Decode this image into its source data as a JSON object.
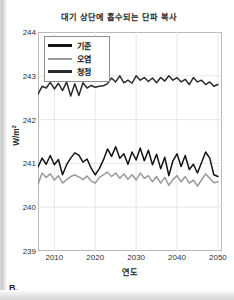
{
  "panel": {
    "label": "B."
  },
  "chart_data": {
    "type": "line",
    "title": "대기 상단에 흡수되는 단파 복사",
    "xlabel": "연도",
    "ylabel": "W/m",
    "ylabel_exponent": "2",
    "xlim": [
      2006,
      2051
    ],
    "ylim": [
      239,
      244
    ],
    "yticks": [
      239,
      240,
      241,
      242,
      243,
      244
    ],
    "ytick_labels": [
      "239",
      "240",
      "241",
      "242",
      "243",
      "244"
    ],
    "xticks": [
      2010,
      2020,
      2030,
      2040,
      2050
    ],
    "xtick_labels": [
      "2010",
      "2020",
      "2030",
      "2040",
      "2050"
    ],
    "grid": true,
    "grid_color": "#e6e6e6",
    "legend_position": "upper left",
    "legend": [
      "기준",
      "오염",
      "청정"
    ],
    "series": [
      {
        "name": "기준",
        "color": "#141414",
        "width": 1.5,
        "x": [
          2006,
          2007,
          2008,
          2009,
          2010,
          2011,
          2012,
          2013,
          2014,
          2015,
          2016,
          2017,
          2018,
          2019,
          2020,
          2021,
          2022,
          2023,
          2024,
          2025,
          2026,
          2027,
          2028,
          2029,
          2030,
          2031,
          2032,
          2033,
          2034,
          2035,
          2036,
          2037,
          2038,
          2039,
          2040,
          2041,
          2042,
          2043,
          2044,
          2045,
          2046,
          2047,
          2048,
          2049,
          2050
        ],
        "values": [
          240.92,
          241.12,
          240.98,
          241.18,
          240.97,
          241.09,
          240.74,
          240.97,
          241.12,
          241.24,
          241.19,
          241.03,
          241.1,
          240.89,
          240.74,
          240.88,
          241.08,
          241.33,
          241.16,
          241.38,
          241.12,
          241.22,
          240.98,
          241.26,
          241.08,
          241.35,
          241.06,
          241.3,
          240.97,
          241.21,
          240.88,
          241.14,
          240.72,
          241.06,
          241.22,
          240.93,
          241.18,
          240.86,
          240.98,
          240.78,
          241.02,
          241.26,
          241.12,
          240.74,
          240.7
        ]
      },
      {
        "name": "오염",
        "color": "#9a9a9a",
        "width": 1.5,
        "x": [
          2006,
          2007,
          2008,
          2009,
          2010,
          2011,
          2012,
          2013,
          2014,
          2015,
          2016,
          2017,
          2018,
          2019,
          2020,
          2021,
          2022,
          2023,
          2024,
          2025,
          2026,
          2027,
          2028,
          2029,
          2030,
          2031,
          2032,
          2033,
          2034,
          2035,
          2036,
          2037,
          2038,
          2039,
          2040,
          2041,
          2042,
          2043,
          2044,
          2045,
          2046,
          2047,
          2048,
          2049,
          2050
        ],
        "values": [
          240.52,
          240.78,
          240.68,
          240.76,
          240.62,
          240.72,
          240.55,
          240.63,
          240.7,
          240.74,
          240.69,
          240.63,
          240.71,
          240.6,
          240.55,
          240.68,
          240.74,
          240.8,
          240.7,
          240.78,
          240.66,
          240.76,
          240.64,
          240.74,
          240.62,
          240.78,
          240.66,
          240.72,
          240.58,
          240.7,
          240.55,
          240.68,
          240.5,
          240.63,
          240.72,
          240.58,
          240.7,
          240.55,
          240.62,
          240.48,
          240.62,
          240.76,
          240.66,
          240.56,
          240.58
        ]
      },
      {
        "name": "청정",
        "color": "#2b2b2b",
        "width": 1.5,
        "x": [
          2006,
          2007,
          2008,
          2009,
          2010,
          2011,
          2012,
          2013,
          2014,
          2015,
          2016,
          2017,
          2018,
          2019,
          2020,
          2021,
          2022,
          2023,
          2024,
          2025,
          2026,
          2027,
          2028,
          2029,
          2030,
          2031,
          2032,
          2033,
          2034,
          2035,
          2036,
          2037,
          2038,
          2039,
          2040,
          2041,
          2042,
          2043,
          2044,
          2045,
          2046,
          2047,
          2048,
          2049,
          2050
        ],
        "values": [
          242.58,
          242.76,
          242.72,
          242.85,
          242.7,
          242.83,
          242.66,
          242.86,
          242.54,
          242.82,
          242.55,
          242.84,
          242.72,
          242.78,
          242.74,
          242.76,
          242.77,
          242.82,
          242.95,
          242.86,
          243.0,
          242.84,
          242.9,
          242.83,
          243.0,
          242.9,
          242.96,
          242.87,
          242.95,
          242.84,
          242.96,
          242.88,
          243.0,
          242.9,
          242.96,
          242.86,
          242.92,
          242.8,
          242.96,
          242.86,
          242.9,
          242.8,
          242.86,
          242.76,
          242.8
        ]
      }
    ]
  }
}
